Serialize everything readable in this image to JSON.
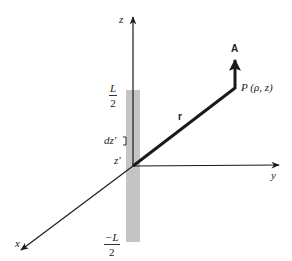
{
  "diagram": {
    "type": "geometry-3d-axes",
    "colors": {
      "line": "#1a1a1a",
      "segment_fill": "#c4c4c4",
      "text": "#222222"
    },
    "axes": {
      "z_label": "z",
      "y_label": "y",
      "x_label": "x"
    },
    "segment": {
      "top_label_num": "L",
      "top_label_den": "2",
      "bottom_label_num": "−L",
      "bottom_label_den": "2",
      "element_label": "dz'",
      "source_point_label": "z'"
    },
    "vectors": {
      "r_label": "r",
      "A_label": "A"
    },
    "point": {
      "label": "P (ρ, z)"
    }
  }
}
